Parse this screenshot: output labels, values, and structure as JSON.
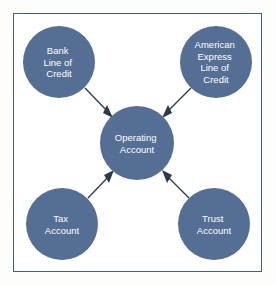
{
  "diagram": {
    "frame_border_color": "#4a5d73",
    "background_color": "#ffffff",
    "node_fill_color": "#546e94",
    "node_text_color": "#ffffff",
    "arrow_color": "#2b3a4d",
    "nodes": [
      {
        "id": "bank-line-of-credit",
        "name": "Bank Line of Credit",
        "lines": [
          "Bank",
          "Line of",
          "Credit"
        ],
        "cx": 59,
        "cy": 62,
        "r": 36
      },
      {
        "id": "american-express-line-of-credit",
        "name": "American Express Line of Credit",
        "lines": [
          "American",
          "Express",
          "Line of",
          "Credit"
        ],
        "cx": 216,
        "cy": 62,
        "r": 36
      },
      {
        "id": "operating-account",
        "name": "Operating Account",
        "lines": [
          "Operating",
          "Account"
        ],
        "cx": 137,
        "cy": 143,
        "r": 37
      },
      {
        "id": "tax-account",
        "name": "Tax Account",
        "lines": [
          "Tax",
          "Account"
        ],
        "cx": 62,
        "cy": 224,
        "r": 36
      },
      {
        "id": "trust-account",
        "name": "Trust Account",
        "lines": [
          "Trust",
          "Account"
        ],
        "cx": 214,
        "cy": 224,
        "r": 36
      }
    ],
    "arrows": [
      {
        "id": "arrow-bank-to-operating",
        "name": "arrow from Bank Line of Credit to Operating Account",
        "from": "bank-line-of-credit",
        "to": "operating-account",
        "x1": 85,
        "y1": 88,
        "x2": 112,
        "y2": 117
      },
      {
        "id": "arrow-amex-to-operating",
        "name": "arrow from American Express Line of Credit to Operating Account",
        "from": "american-express-line-of-credit",
        "to": "operating-account",
        "x1": 191,
        "y1": 88,
        "x2": 163,
        "y2": 117
      },
      {
        "id": "arrow-tax-to-operating",
        "name": "arrow from Tax Account to Operating Account",
        "from": "tax-account",
        "to": "operating-account",
        "x1": 88,
        "y1": 198,
        "x2": 112,
        "y2": 171
      },
      {
        "id": "arrow-trust-to-operating",
        "name": "arrow from Trust Account to Operating Account",
        "from": "trust-account",
        "to": "operating-account",
        "x1": 189,
        "y1": 198,
        "x2": 164,
        "y2": 171
      }
    ]
  }
}
